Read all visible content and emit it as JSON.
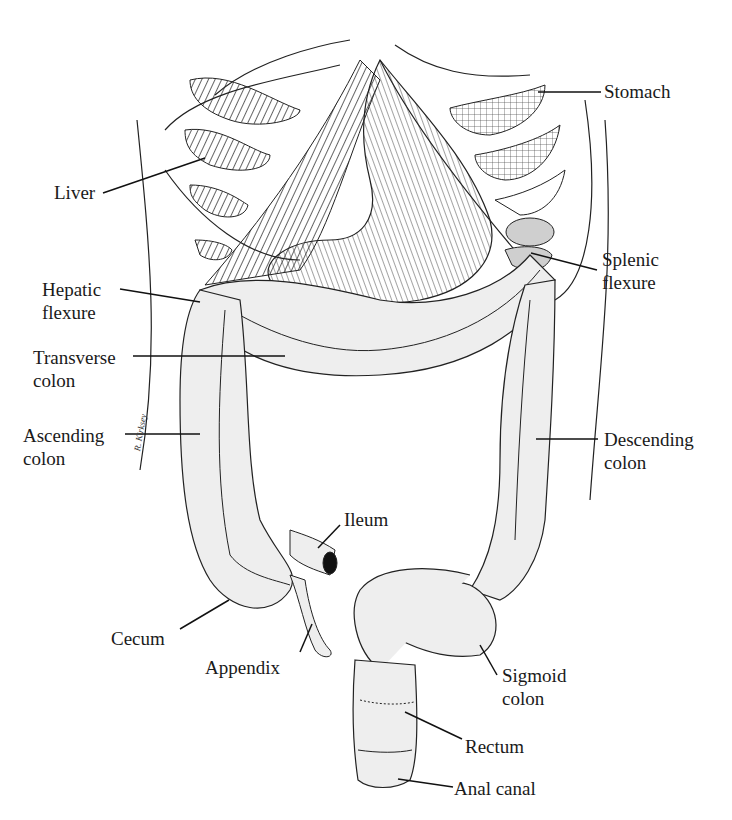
{
  "diagram": {
    "type": "anatomical illustration",
    "signature": "R. Kirksey",
    "colors": {
      "line": "#1a1a1a",
      "fill": "#eeeeee",
      "shade": "#cfcfcf",
      "background": "#ffffff"
    },
    "labels": {
      "stomach": {
        "lines": [
          "Stomach"
        ]
      },
      "liver": {
        "lines": [
          "Liver"
        ]
      },
      "splenic_flexure": {
        "lines": [
          "Splenic",
          "flexure"
        ]
      },
      "hepatic_flexure": {
        "lines": [
          "Hepatic",
          "flexure"
        ]
      },
      "transverse_colon": {
        "lines": [
          "Transverse",
          "colon"
        ]
      },
      "ascending_colon": {
        "lines": [
          "Ascending",
          "colon"
        ]
      },
      "descending_colon": {
        "lines": [
          "Descending",
          "colon"
        ]
      },
      "ileum": {
        "lines": [
          "Ileum"
        ]
      },
      "cecum": {
        "lines": [
          "Cecum"
        ]
      },
      "appendix": {
        "lines": [
          "Appendix"
        ]
      },
      "sigmoid_colon": {
        "lines": [
          "Sigmoid",
          "colon"
        ]
      },
      "rectum": {
        "lines": [
          "Rectum"
        ]
      },
      "anal_canal": {
        "lines": [
          "Anal canal"
        ]
      }
    }
  }
}
